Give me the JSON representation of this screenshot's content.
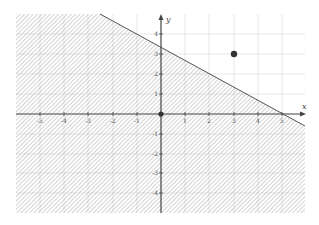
{
  "figure": {
    "type": "linear-inequality-graph",
    "inequality_region": "shaded half-plane below boundary line 2x + 3y = 10",
    "boundary_line": {
      "slope": -0.6667,
      "y_intercept": 3.333,
      "x_intercept": 5
    },
    "axes": {
      "x_label": "x",
      "y_label": "y",
      "x_ticks": [
        "-5",
        "-4",
        "-3",
        "-2",
        "-1",
        "1",
        "2",
        "3",
        "4",
        "5"
      ],
      "y_ticks": [
        "4",
        "3",
        "2",
        "1",
        "-1",
        "-2",
        "-3",
        "-4"
      ],
      "x_range": [
        -5.8,
        5.8
      ],
      "y_range": [
        -5,
        5
      ]
    },
    "points": [
      {
        "label": "",
        "x": 3,
        "y": 3
      },
      {
        "label": "",
        "x": 0,
        "y": 0
      }
    ],
    "colors": {
      "axis": "#444444",
      "grid": "#d6d6d6",
      "hatch": "#9a9a9a",
      "boundary": "#555555",
      "point": "#333333"
    }
  }
}
